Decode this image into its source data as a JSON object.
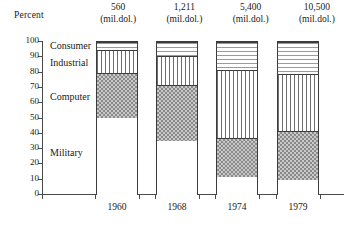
{
  "axis": {
    "y_title": "Percent",
    "y_ticks": [
      100,
      90,
      80,
      70,
      60,
      50,
      40,
      30,
      20,
      10,
      0
    ],
    "x_ticks": [
      "1960",
      "1968",
      "1974",
      "1979"
    ]
  },
  "columns": [
    {
      "value": "560",
      "unit": "(mil.dol.)",
      "year": "1960"
    },
    {
      "value": "1,211",
      "unit": "(mil.dol.)",
      "year": "1968"
    },
    {
      "value": "5,400",
      "unit": "(mil.dol.)",
      "year": "1974"
    },
    {
      "value": "10,500",
      "unit": "(mil.dol.)",
      "year": "1979"
    }
  ],
  "categories": [
    {
      "key": "consumer",
      "label": "Consumer"
    },
    {
      "key": "industrial",
      "label": "Industrial"
    },
    {
      "key": "computer",
      "label": "Computer"
    },
    {
      "key": "military",
      "label": "Military"
    }
  ],
  "chart_data": {
    "type": "bar",
    "subtype": "stacked-100-percent",
    "title": "",
    "xlabel": "",
    "ylabel": "Percent",
    "ylim": [
      0,
      100
    ],
    "ytick_step": 10,
    "grid": false,
    "legend": "inline-left-labels",
    "categories": [
      "1960",
      "1968",
      "1974",
      "1979"
    ],
    "column_totals": [
      "560",
      "1,211",
      "5,400",
      "10,500"
    ],
    "column_total_unit": "(mil.dol.)",
    "series": [
      {
        "name": "Military",
        "values": [
          50,
          35,
          12,
          10
        ]
      },
      {
        "name": "Computer",
        "values": [
          30,
          37,
          25,
          32
        ]
      },
      {
        "name": "Industrial",
        "values": [
          15,
          19,
          45,
          37
        ]
      },
      {
        "name": "Consumer",
        "values": [
          5,
          9,
          18,
          21
        ]
      }
    ],
    "cumulative_tops": {
      "Military": [
        50,
        35,
        12,
        10
      ],
      "Computer": [
        80,
        72,
        37,
        42
      ],
      "Industrial": [
        95,
        91,
        82,
        79
      ],
      "Consumer": [
        100,
        100,
        100,
        100
      ]
    }
  }
}
